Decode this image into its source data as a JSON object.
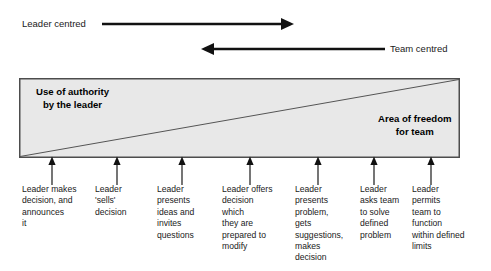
{
  "diagram": {
    "axes": [
      {
        "id": "leader-centred",
        "label": "Leader centred",
        "direction": "right",
        "label_x": 22,
        "line_from": 102,
        "line_to": 290,
        "y": 24
      },
      {
        "id": "team-centred",
        "label": "Team centred",
        "direction": "left",
        "label_x": 390,
        "line_from": 385,
        "line_to": 202,
        "y": 49
      }
    ],
    "box": {
      "left": 19,
      "top": 78,
      "width": 441,
      "height": 80,
      "fill": "#e8e8e8",
      "border": "#4d4d4d",
      "diagonal": "bottom-left-to-top-right"
    },
    "zones": [
      {
        "id": "use-of-authority",
        "line1": "Use of authority",
        "line2": "by the leader"
      },
      {
        "id": "area-of-freedom",
        "line1": "Area of freedom",
        "line2": "for team"
      }
    ],
    "pointers_x": [
      52,
      117,
      182,
      250,
      318,
      374,
      431
    ],
    "steps": [
      {
        "id": "step-1",
        "x": 22,
        "width": 72,
        "lines": [
          "Leader makes",
          "decision, and",
          "announces",
          "it"
        ]
      },
      {
        "id": "step-2",
        "x": 95,
        "width": 58,
        "lines": [
          "Leader",
          "'sells'",
          "decision"
        ]
      },
      {
        "id": "step-3",
        "x": 157,
        "width": 62,
        "lines": [
          "Leader",
          "presents",
          "ideas and",
          "invites",
          "questions"
        ]
      },
      {
        "id": "step-4",
        "x": 222,
        "width": 70,
        "lines": [
          "Leader offers",
          "decision",
          "which",
          "they are",
          "prepared to",
          "modify"
        ]
      },
      {
        "id": "step-5",
        "x": 295,
        "width": 62,
        "lines": [
          "Leader",
          "presents",
          "problem,",
          "gets",
          "suggestions,",
          "makes",
          "decision"
        ]
      },
      {
        "id": "step-6",
        "x": 360,
        "width": 50,
        "lines": [
          "Leader",
          "asks team",
          "to solve",
          "defined",
          "problem"
        ]
      },
      {
        "id": "step-7",
        "x": 412,
        "width": 72,
        "lines": [
          "Leader",
          "permits",
          "team to",
          "function",
          "within defined",
          "limits"
        ]
      }
    ],
    "colors": {
      "ink": "#1a1a1a",
      "box_fill": "#e8e8e8",
      "box_border": "#4d4d4d",
      "arrow": "#111111"
    }
  }
}
